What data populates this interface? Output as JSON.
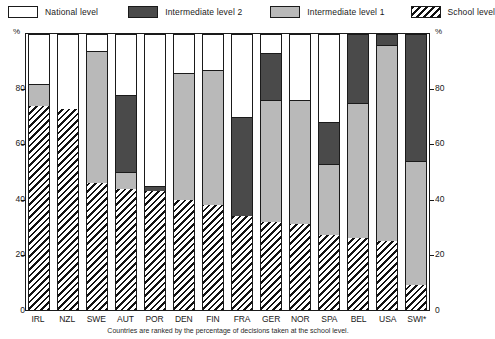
{
  "legend": {
    "items": [
      {
        "label": "National level",
        "key": "national",
        "color": "#ffffff"
      },
      {
        "label": "Intermediate level 2",
        "key": "int2",
        "color": "#4a4a4a"
      },
      {
        "label": "Intermediate level 1",
        "key": "int1",
        "color": "#b9b9b9"
      },
      {
        "label": "School level",
        "key": "school",
        "color": "hatch"
      }
    ]
  },
  "axis": {
    "unit_left": "%",
    "unit_right": "%",
    "yticks": [
      "0",
      "20",
      "40",
      "60",
      "80"
    ]
  },
  "footnote": "Countries are ranked by the percentage of decisions taken at the school level.",
  "chart_data": {
    "type": "bar",
    "stacked": true,
    "title": "",
    "xlabel": "",
    "ylabel": "%",
    "ylim": [
      0,
      100
    ],
    "yticks": [
      0,
      20,
      40,
      60,
      80
    ],
    "grid": false,
    "legend_position": "top",
    "categories": [
      "IRL",
      "NZL",
      "SWE",
      "AUT",
      "POR",
      "DEN",
      "FIN",
      "FRA",
      "GER",
      "NOR",
      "SPA",
      "BEL",
      "USA",
      "SWI*"
    ],
    "series": [
      {
        "name": "School level",
        "key": "school",
        "values": [
          74,
          73,
          46,
          44,
          43,
          40,
          38,
          34,
          32,
          31,
          27,
          26,
          25,
          9
        ]
      },
      {
        "name": "Intermediate level 1",
        "key": "int1",
        "values": [
          8,
          0,
          48,
          6,
          0,
          46,
          49,
          0,
          44,
          45,
          26,
          49,
          71,
          45
        ]
      },
      {
        "name": "Intermediate level 2",
        "key": "int2",
        "values": [
          0,
          0,
          0,
          28,
          2,
          0,
          0,
          36,
          17,
          0,
          15,
          25,
          4,
          46
        ]
      },
      {
        "name": "National level",
        "key": "national",
        "values": [
          18,
          27,
          6,
          22,
          55,
          14,
          13,
          30,
          7,
          24,
          32,
          0,
          0,
          0
        ]
      }
    ]
  }
}
